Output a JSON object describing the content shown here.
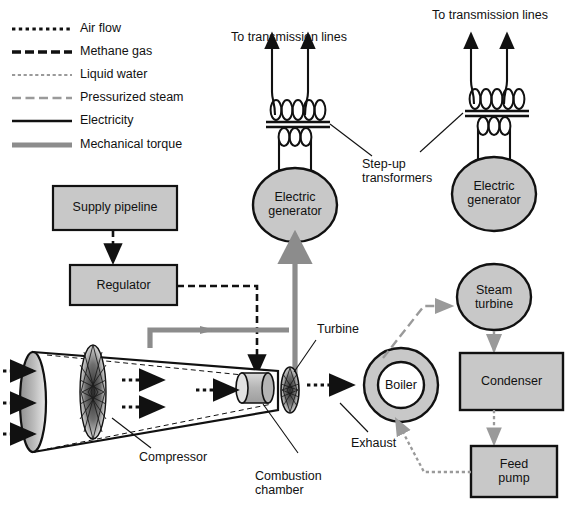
{
  "figure": {
    "background": "#ffffff"
  },
  "colors": {
    "stroke": "#111111",
    "gray_fill": "#c8c8c8",
    "gray_line": "#9a9a9a",
    "torque_gray": "#8c8c8c",
    "white_fill": "#ffffff",
    "text": "#111111"
  },
  "legend": {
    "items": [
      {
        "label": "Air flow",
        "style": "dotted",
        "color": "#111111",
        "width": 3.2
      },
      {
        "label": "Methane gas",
        "style": "dashed",
        "color": "#111111",
        "width": 3.2
      },
      {
        "label": "Liquid water",
        "style": "fine-dotted",
        "color": "#9a9a9a",
        "width": 2.2
      },
      {
        "label": "Pressurized steam",
        "style": "dashed",
        "color": "#9a9a9a",
        "width": 2.2
      },
      {
        "label": "Electricity",
        "style": "solid",
        "color": "#111111",
        "width": 2.2
      },
      {
        "label": "Mechanical torque",
        "style": "solid",
        "color": "#8c8c8c",
        "width": 5.0
      }
    ]
  },
  "nodes": {
    "supply_pipeline": "Supply pipeline",
    "regulator": "Regulator",
    "electric_generator_left": "Electric\ngenerator",
    "electric_generator_right": "Electric\ngenerator",
    "steam_turbine": "Steam\nturbine",
    "boiler": "Boiler",
    "condenser": "Condenser",
    "feed_pump": "Feed\npump"
  },
  "annotations": {
    "to_transmission_lines_left": "To transmission lines",
    "to_transmission_lines_right": "To transmission lines",
    "step_up_transformers": "Step-up\ntransformers",
    "turbine": "Turbine",
    "compressor": "Compressor",
    "combustion_chamber": "Combustion\nchamber",
    "exhaust": "Exhaust"
  }
}
